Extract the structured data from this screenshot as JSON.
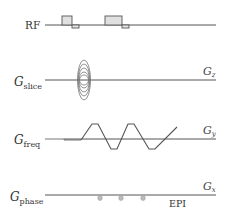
{
  "diagram": {
    "type": "EPI pulse sequence diagram",
    "rows": [
      {
        "id": "rf",
        "label": "RF",
        "label_sub": ""
      },
      {
        "id": "slice",
        "label": "G",
        "label_sub": "slice",
        "axis": "G",
        "axis_sub": "z"
      },
      {
        "id": "freq",
        "label": "G",
        "label_sub": "freq",
        "axis": "G",
        "axis_sub": "y"
      },
      {
        "id": "phase",
        "label": "G",
        "label_sub": "phase",
        "axis": "G",
        "axis_sub": "x"
      }
    ],
    "sequence_label": "EPI",
    "colors": {
      "line": "#555555",
      "pulse_fill": "#e0e0e0",
      "blip_fill": "#bbbbbb",
      "text": "#333333"
    }
  }
}
